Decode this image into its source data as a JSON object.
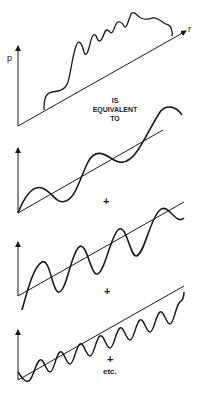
{
  "diagram": {
    "top_plot": {
      "y_axis_label": "p",
      "x_axis_label": "r"
    },
    "caption": {
      "line1": "IS",
      "line2": "EQUIVALENT",
      "line3": "TO"
    },
    "components": [
      {
        "name": "component-1",
        "relative_frequency": 1,
        "separator": "+"
      },
      {
        "name": "component-2",
        "relative_frequency": 2,
        "separator": "+"
      },
      {
        "name": "component-3",
        "relative_frequency": 4,
        "separator": "+"
      }
    ],
    "trailing_text": "etc.",
    "colors": {
      "ink": "#1a1a1a",
      "background": "#ffffff"
    }
  }
}
